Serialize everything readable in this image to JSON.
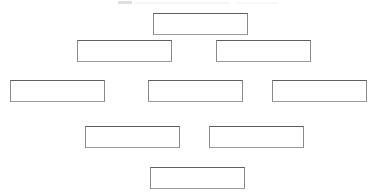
{
  "canvas": {
    "width": 372,
    "height": 196,
    "background_color": "#ffffff",
    "border_color": "#7d7d7d"
  },
  "diagram": {
    "type": "hierarchy",
    "row_count": 5,
    "node_count": 9,
    "rows": [
      {
        "index": 0,
        "node_count": 1
      },
      {
        "index": 1,
        "node_count": 2
      },
      {
        "index": 2,
        "node_count": 3
      },
      {
        "index": 3,
        "node_count": 2
      },
      {
        "index": 4,
        "node_count": 1
      }
    ],
    "nodes": [
      {
        "id": "node-1",
        "row": 0,
        "label": "",
        "x": 153,
        "y": 13,
        "width": 95,
        "height": 22
      },
      {
        "id": "node-2",
        "row": 1,
        "label": "",
        "x": 77,
        "y": 40,
        "width": 95,
        "height": 22
      },
      {
        "id": "node-3",
        "row": 1,
        "label": "",
        "x": 216,
        "y": 40,
        "width": 95,
        "height": 22
      },
      {
        "id": "node-4",
        "row": 2,
        "label": "",
        "x": 10,
        "y": 80,
        "width": 95,
        "height": 22
      },
      {
        "id": "node-5",
        "row": 2,
        "label": "",
        "x": 148,
        "y": 80,
        "width": 95,
        "height": 22
      },
      {
        "id": "node-6",
        "row": 2,
        "label": "",
        "x": 272,
        "y": 80,
        "width": 95,
        "height": 22
      },
      {
        "id": "node-7",
        "row": 3,
        "label": "",
        "x": 85,
        "y": 126,
        "width": 95,
        "height": 22
      },
      {
        "id": "node-8",
        "row": 3,
        "label": "",
        "x": 209,
        "y": 126,
        "width": 95,
        "height": 22
      },
      {
        "id": "node-9",
        "row": 4,
        "label": "",
        "x": 150,
        "y": 167,
        "width": 95,
        "height": 22
      }
    ]
  }
}
